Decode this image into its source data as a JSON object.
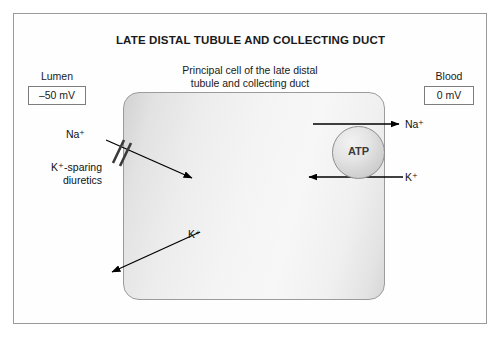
{
  "title": "LATE DISTAL TUBULE AND COLLECTING DUCT",
  "cell": {
    "caption_line1": "Principal cell of the late distal",
    "caption_line2": "tubule and collecting duct",
    "pump_label": "ATP"
  },
  "lumen": {
    "label": "Lumen",
    "voltage": "–50 mV",
    "na_label": "Na⁺",
    "k_label": "K⁺",
    "drug_line1": "K⁺-sparing",
    "drug_line2": "diuretics"
  },
  "blood": {
    "label": "Blood",
    "voltage": "0 mV",
    "na_label": "Na⁺",
    "k_label": "K⁺"
  },
  "colors": {
    "frame_border": "#9a9a9a",
    "cell_border": "#9b9b9b",
    "arrow": "#000000",
    "text": "#1a1a1a",
    "pump_border": "#8d8d8d"
  }
}
